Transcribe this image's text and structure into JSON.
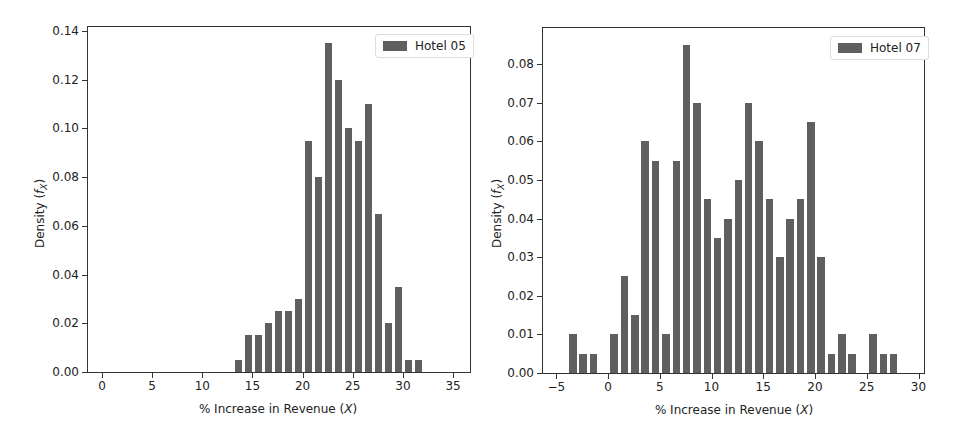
{
  "chart_data": [
    {
      "type": "bar",
      "title": "",
      "xlabel": "% Increase in Revenue (X)",
      "ylabel": "Density (f_X)",
      "legend": [
        "Hotel 05"
      ],
      "legend_position": "upper right",
      "grid": false,
      "xlim": [
        -1.5,
        36.5
      ],
      "ylim": [
        0,
        0.14
      ],
      "xticks": [
        "0",
        "5",
        "10",
        "15",
        "20",
        "25",
        "30",
        "35"
      ],
      "yticks": [
        "0.00",
        "0.02",
        "0.04",
        "0.06",
        "0.08",
        "0.10",
        "0.12",
        "0.14"
      ],
      "series": [
        {
          "name": "Hotel 05",
          "x": [
            14,
            15,
            16,
            17,
            18,
            19,
            20,
            21,
            22,
            23,
            24,
            25,
            26,
            27,
            28,
            29,
            30,
            31,
            32
          ],
          "values": [
            0.005,
            0.015,
            0.015,
            0.02,
            0.025,
            0.025,
            0.03,
            0.095,
            0.08,
            0.135,
            0.12,
            0.1,
            0.095,
            0.11,
            0.065,
            0.02,
            0.035,
            0.005,
            0.005
          ]
        }
      ]
    },
    {
      "type": "bar",
      "title": "",
      "xlabel": "% Increase in Revenue (X)",
      "ylabel": "Density (f_X)",
      "legend": [
        "Hotel 07"
      ],
      "legend_position": "upper right",
      "grid": false,
      "xlim": [
        -6.5,
        30.5
      ],
      "ylim": [
        0,
        0.089
      ],
      "xticks": [
        "−5",
        "0",
        "5",
        "10",
        "15",
        "20",
        "25",
        "30"
      ],
      "yticks": [
        "0.00",
        "0.01",
        "0.02",
        "0.03",
        "0.04",
        "0.05",
        "0.06",
        "0.07",
        "0.08"
      ],
      "series": [
        {
          "name": "Hotel 07",
          "x": [
            -3,
            -2,
            -1,
            0,
            1,
            2,
            3,
            4,
            5,
            6,
            7,
            8,
            9,
            10,
            11,
            12,
            13,
            14,
            15,
            16,
            17,
            18,
            19,
            20,
            21,
            22,
            23,
            24,
            25,
            26,
            27,
            28
          ],
          "values": [
            0.01,
            0.005,
            0.005,
            0,
            0.01,
            0.025,
            0.015,
            0.06,
            0.055,
            0.01,
            0.055,
            0.085,
            0.07,
            0.045,
            0.035,
            0.04,
            0.05,
            0.07,
            0.06,
            0.045,
            0.03,
            0.04,
            0.045,
            0.065,
            0.03,
            0.005,
            0.01,
            0.005,
            0,
            0.01,
            0.005,
            0.005
          ]
        }
      ]
    }
  ],
  "charts": [
    {
      "legend_label": "Hotel 05",
      "xlabel": "% Increase in Revenue (",
      "xvar": "X",
      "ylabel": "Density (",
      "yvar": "f",
      "ysub": "X"
    },
    {
      "legend_label": "Hotel 07",
      "xlabel": "% Increase in Revenue (",
      "xvar": "X",
      "ylabel": "Density (",
      "yvar": "f",
      "ysub": "X"
    }
  ]
}
